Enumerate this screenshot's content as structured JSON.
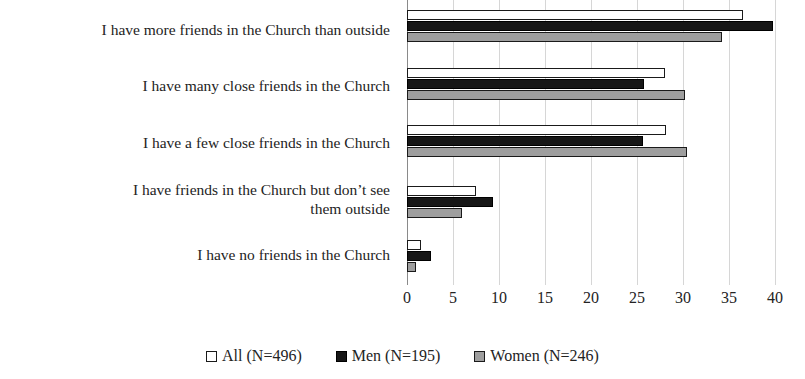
{
  "chart_data": {
    "type": "bar",
    "orientation": "horizontal",
    "title": "",
    "subtitle": "",
    "xlabel": "",
    "ylabel": "",
    "xlim": [
      0,
      40
    ],
    "xticks": [
      0,
      5,
      10,
      15,
      20,
      25,
      30,
      35,
      40
    ],
    "tick_labels": [
      "0",
      "5",
      "10",
      "15",
      "20",
      "25",
      "30",
      "35",
      "40"
    ],
    "grid": true,
    "legend_position": "bottom",
    "categories": [
      "I have more friends in the Church than outside",
      "I have many close friends in the Church",
      "I have a few close friends in the Church",
      "I have friends in the Church but don’t see them outside",
      "I have no friends in the Church"
    ],
    "series": [
      {
        "name": "All (N=496)",
        "color": "#ffffff",
        "values": [
          36.5,
          28.0,
          28.2,
          7.5,
          1.5
        ]
      },
      {
        "name": "Men (N=195)",
        "color": "#171717",
        "values": [
          39.8,
          25.8,
          25.6,
          9.4,
          2.6
        ]
      },
      {
        "name": "Women (N=246)",
        "color": "#9e9e9e",
        "values": [
          34.2,
          30.2,
          30.4,
          6.0,
          1.0
        ]
      }
    ]
  },
  "legend": {
    "items": [
      {
        "label": "All (N=496)",
        "swatch": "white-square-icon"
      },
      {
        "label": "Men (N=195)",
        "swatch": "black-square-icon"
      },
      {
        "label": "Women (N=246)",
        "swatch": "gray-square-icon"
      }
    ]
  },
  "colors": {
    "all": "#ffffff",
    "men": "#171717",
    "women": "#9e9e9e",
    "grid": "#d6d6d6",
    "axis": "#8a8a8a",
    "text": "#232323"
  }
}
